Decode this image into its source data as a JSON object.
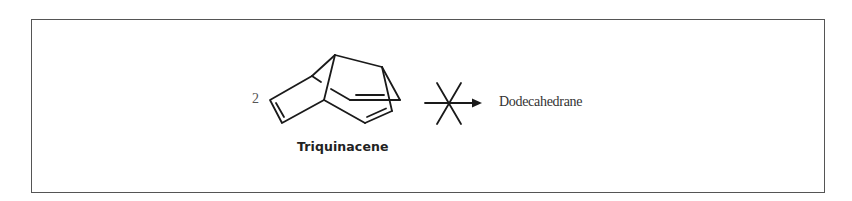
{
  "scheme": {
    "reactant": {
      "coefficient": "2",
      "name": "Triquinacene"
    },
    "arrow": {
      "type": "crossed-out-reaction-arrow",
      "meaning": "does not proceed"
    },
    "product": {
      "name": "Dodecahedrane"
    }
  }
}
